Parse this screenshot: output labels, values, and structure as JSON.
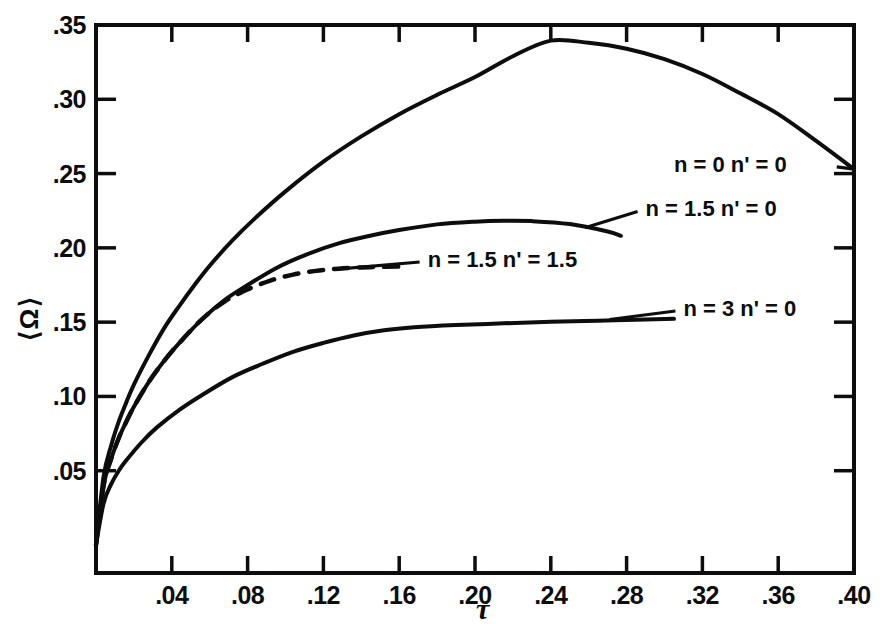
{
  "figure": {
    "background_color": "#ffffff",
    "ink_color": "#0d0d0d"
  },
  "chart_data": {
    "type": "line",
    "title": "",
    "xlabel": "τ",
    "ylabel": "⟨Ω⟩",
    "xlim": [
      0.0,
      0.4
    ],
    "ylim": [
      0.0,
      0.35
    ],
    "xticks": [
      0.04,
      0.08,
      0.12,
      0.16,
      0.2,
      0.24,
      0.28,
      0.32,
      0.36,
      0.4
    ],
    "xtick_labels": [
      ".04",
      ".08",
      ".12",
      ".16",
      ".20",
      ".24",
      ".28",
      ".32",
      ".36",
      ".40"
    ],
    "yticks": [
      0.05,
      0.1,
      0.15,
      0.2,
      0.25,
      0.3,
      0.35
    ],
    "ytick_labels": [
      ".05",
      ".10",
      ".15",
      ".20",
      ".25",
      ".30",
      ".35"
    ],
    "grid": false,
    "legend_position": "inline-annotations",
    "series": [
      {
        "name": "n = 0  n' = 0",
        "label": "n = 0   n' = 0",
        "style": "solid",
        "x": [
          0.0,
          0.004,
          0.008,
          0.012,
          0.016,
          0.02,
          0.028,
          0.036,
          0.044,
          0.052,
          0.06,
          0.072,
          0.084,
          0.1,
          0.12,
          0.14,
          0.16,
          0.18,
          0.2,
          0.22,
          0.24,
          0.26,
          0.28,
          0.3,
          0.32,
          0.34,
          0.36,
          0.38,
          0.4
        ],
        "y": [
          0.0,
          0.046,
          0.067,
          0.083,
          0.096,
          0.108,
          0.128,
          0.146,
          0.161,
          0.175,
          0.188,
          0.205,
          0.22,
          0.238,
          0.258,
          0.275,
          0.29,
          0.303,
          0.315,
          0.329,
          0.3395,
          0.338,
          0.334,
          0.327,
          0.317,
          0.304,
          0.29,
          0.272,
          0.253
        ]
      },
      {
        "name": "n = 1.5  n' = 0",
        "label": "n = 1.5  n' = 0",
        "style": "solid",
        "x": [
          0.0,
          0.004,
          0.008,
          0.012,
          0.016,
          0.02,
          0.028,
          0.036,
          0.044,
          0.056,
          0.068,
          0.08,
          0.096,
          0.112,
          0.128,
          0.144,
          0.16,
          0.18,
          0.2,
          0.215,
          0.23,
          0.25,
          0.27,
          0.277
        ],
        "y": [
          0.0,
          0.04,
          0.058,
          0.072,
          0.083,
          0.093,
          0.11,
          0.124,
          0.136,
          0.152,
          0.165,
          0.175,
          0.187,
          0.196,
          0.203,
          0.208,
          0.212,
          0.2158,
          0.2176,
          0.2182,
          0.218,
          0.216,
          0.211,
          0.2081
        ]
      },
      {
        "name": "n = 1.5  n' = 1.5",
        "label": "n = 1.5   n' = 1.5",
        "style": "dashed",
        "x": [
          0.0,
          0.004,
          0.008,
          0.012,
          0.016,
          0.02,
          0.028,
          0.036,
          0.044,
          0.056,
          0.068,
          0.08,
          0.092,
          0.104,
          0.116,
          0.128,
          0.14,
          0.152,
          0.16
        ],
        "y": [
          0.0,
          0.04,
          0.058,
          0.072,
          0.083,
          0.093,
          0.11,
          0.124,
          0.136,
          0.152,
          0.164,
          0.172,
          0.178,
          0.182,
          0.1845,
          0.186,
          0.1868,
          0.1872,
          0.1874
        ]
      },
      {
        "name": "n = 3  n' = 0",
        "label": "n = 3  n' = 0",
        "style": "solid",
        "x": [
          0.0,
          0.004,
          0.008,
          0.012,
          0.016,
          0.024,
          0.032,
          0.044,
          0.056,
          0.072,
          0.088,
          0.104,
          0.12,
          0.136,
          0.152,
          0.168,
          0.19,
          0.215,
          0.24,
          0.265,
          0.29,
          0.305
        ],
        "y": [
          0.0,
          0.028,
          0.041,
          0.05,
          0.057,
          0.069,
          0.079,
          0.091,
          0.101,
          0.113,
          0.122,
          0.13,
          0.136,
          0.141,
          0.1445,
          0.1465,
          0.148,
          0.1492,
          0.1502,
          0.151,
          0.1518,
          0.1522
        ]
      }
    ],
    "annotations": [
      {
        "text": "n = 0   n' = 0",
        "anchor_x": 0.305,
        "anchor_y": 0.2545,
        "leader": true,
        "leader_to_x": 0.4,
        "leader_to_y": 0.253
      },
      {
        "text": "n = 1.5  n' = 0",
        "anchor_x": 0.29,
        "anchor_y": 0.2245,
        "leader": true,
        "leader_to_x": 0.258,
        "leader_to_y": 0.2135
      },
      {
        "text": "n = 1.5   n' = 1.5",
        "anchor_x": 0.175,
        "anchor_y": 0.1905,
        "leader": true,
        "leader_to_x": 0.126,
        "leader_to_y": 0.1855
      },
      {
        "text": "n = 3  n' = 0",
        "anchor_x": 0.31,
        "anchor_y": 0.1575,
        "leader": true,
        "leader_to_x": 0.271,
        "leader_to_y": 0.1518
      }
    ]
  }
}
